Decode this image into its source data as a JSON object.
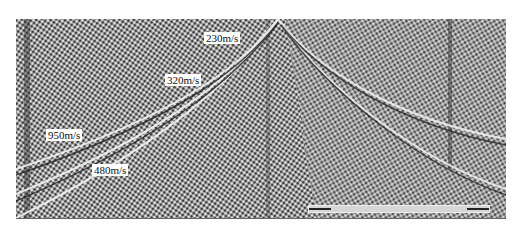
{
  "figure": {
    "labels": [
      {
        "id": "v230",
        "text": "230m/s",
        "x": 204,
        "y": 32
      },
      {
        "id": "v320",
        "text": "320m/s",
        "x": 165,
        "y": 74
      },
      {
        "id": "v950",
        "text": "950m/s",
        "x": 46,
        "y": 129
      },
      {
        "id": "v480",
        "text": "480m/s",
        "x": 92,
        "y": 164
      }
    ],
    "colors": {
      "background": "#ffffff",
      "label_bg": "#ffffff",
      "label_text": "#111111",
      "gather_mid": "#8a8a8a"
    }
  }
}
